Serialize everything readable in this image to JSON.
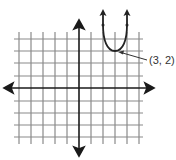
{
  "figure": {
    "type": "coordinate-plane",
    "grid": {
      "x_range": [
        -5,
        5
      ],
      "y_range": [
        -5,
        4
      ],
      "line_color": "#8a8a8a",
      "axis_color": "#1a1a1a"
    },
    "curve": {
      "kind": "parabola",
      "opens": "up",
      "vertex": [
        3,
        2
      ],
      "color": "#222222"
    },
    "annotation": {
      "text": "(3, 2)",
      "points_to": "vertex"
    }
  }
}
